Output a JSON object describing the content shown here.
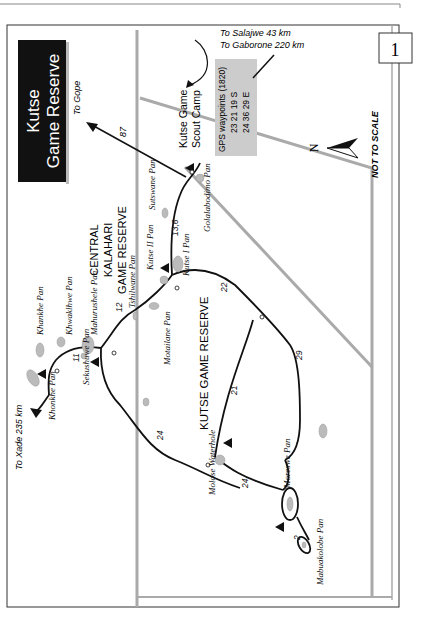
{
  "page": {
    "page_number_box": "1"
  },
  "map": {
    "title_line1": "Kutse",
    "title_line2": "Game Reserve",
    "region_label": [
      "CENTRAL",
      "KALAHARI",
      "GAME RESERVE"
    ],
    "reserve_label": "KUTSE GAME RESERVE",
    "not_to_scale": "NOT TO SCALE",
    "north_label": "N",
    "directions": {
      "to_gope": "To Gope",
      "to_salajwe": "To Salajwe  43 km",
      "to_gaborone": "To Gaborone  220 km",
      "to_xade": "To Xade  235 km"
    },
    "camp": {
      "line1": "Kutse Game",
      "line2": "Scout Camp"
    },
    "gps": {
      "title": "GPS waypoints (1820)",
      "lat": "23 21 19 S",
      "lon": "24 36 29 E"
    },
    "pans": [
      "Khankhe Pan",
      "Khwaklhwe Pan",
      "Mahurushele Pan",
      "Tshilwane Pan",
      "Kutse II Pan",
      "Kutse I Pan",
      "Sutswane Pan",
      "Golalabodimo Pan",
      "Motailane Pan",
      "Sekushuwe Pan",
      "Khonkhe Pan",
      "Molose Waterhole",
      "Moreswe Pan",
      "Mabuakolobe Pan"
    ],
    "distances": {
      "gope": "87",
      "sutswane": "13,6",
      "tshilwane": "12",
      "sekushuwe": "11",
      "kutse_to_junction": "22",
      "east_loop": "29",
      "cross_road": "21",
      "molose_west": "24",
      "molose_east": "24",
      "mabuakolobe": "2"
    }
  }
}
